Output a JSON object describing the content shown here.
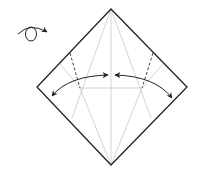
{
  "diagram": {
    "turn_over_icon": "turn-over-icon",
    "colors": {
      "outline": "#222222",
      "crease": "#c8c8c8",
      "valley": "#333333",
      "arrow": "#333333",
      "background": "#ffffff"
    },
    "paper": {
      "top": [
        111,
        9
      ],
      "left": [
        37,
        87
      ],
      "right": [
        187,
        87
      ],
      "bottom": [
        111,
        165
      ]
    }
  }
}
